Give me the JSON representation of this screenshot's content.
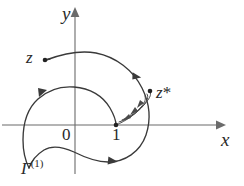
{
  "figure": {
    "kind": "complex-plane-contour-diagram",
    "background_color": "#ffffff",
    "ink_color": "#3a3a3a",
    "axis_color": "#6b6b6b",
    "width": 244,
    "height": 186
  },
  "axes": {
    "y_axis_label": "y",
    "x_axis_label": "x",
    "origin_label": "0",
    "unit_label": "1",
    "x_axis_y_pixel": 125,
    "y_axis_x_pixel": 75,
    "unit_x_pixel": 116
  },
  "points": {
    "z": {
      "label": "z",
      "dot_x": 45,
      "dot_y": 60
    },
    "z_star": {
      "label": "z",
      "star": "*",
      "dot_x": 150,
      "dot_y": 92
    },
    "one": {
      "label": "1",
      "dot_x": 116,
      "dot_y": 125
    }
  },
  "contour": {
    "name_label": "Γ",
    "name_superscript": "(1)",
    "full_name": "Γ⁽¹⁾",
    "description": "closed loop about the branch point at 1 with a spiral approach toward z*",
    "direction_arrow_count": 7
  },
  "icons": {
    "y_axis_arrow": "arrow-up-icon",
    "x_axis_arrow": "arrow-right-icon",
    "contour_direction": "arrowhead-icon",
    "endpoint_marker": "dot-icon"
  }
}
